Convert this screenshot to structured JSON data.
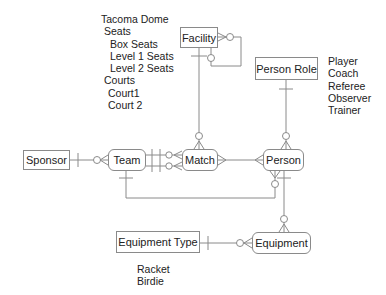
{
  "entities": {
    "facility": "Facility",
    "person_role": "Person Role",
    "sponsor": "Sponsor",
    "team": "Team",
    "match": "Match",
    "person": "Person",
    "equipment_type": "Equipment Type",
    "equipment": "Equipment"
  },
  "notes": {
    "facility_examples": [
      "Tacoma Dome",
      "Seats",
      "Box Seats",
      "Level 1 Seats",
      "Level 2 Seats",
      "Courts",
      "Court1",
      "Court 2"
    ],
    "person_role_examples": [
      "Player",
      "Coach",
      "Referee",
      "Observer",
      "Trainer"
    ],
    "equipment_type_examples": [
      "Racket",
      "Birdie"
    ]
  },
  "colors": {
    "line": "#8a8a8a",
    "border": "#8a8a8a",
    "text": "#222222"
  }
}
